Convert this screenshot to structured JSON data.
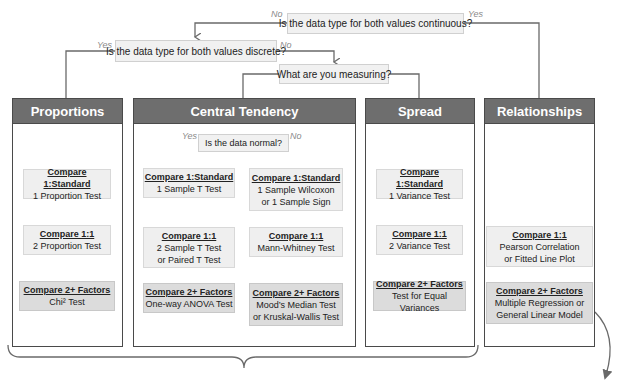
{
  "questions": {
    "continuous": "Is the data type for both values continuous?",
    "discrete": "Is the data type for both values discrete?",
    "measuring": "What are you measuring?",
    "normal": "Is the data normal?"
  },
  "branch_labels": {
    "continuous_no": "No",
    "continuous_yes": "Yes",
    "discrete_yes": "Yes",
    "discrete_no": "No",
    "normal_yes": "Yes",
    "normal_no": "No"
  },
  "panels": {
    "proportions": {
      "title": "Proportions",
      "boxes": [
        {
          "heading": "Compare 1:Standard",
          "lines": [
            "1 Proportion Test"
          ]
        },
        {
          "heading": "Compare 1:1",
          "lines": [
            "2 Proportion Test"
          ]
        },
        {
          "heading": "Compare 2+ Factors",
          "lines": [
            "Chi² Test"
          ]
        }
      ]
    },
    "central_tendency": {
      "title": "Central Tendency",
      "normal_yes": [
        {
          "heading": "Compare 1:Standard",
          "lines": [
            "1 Sample T Test"
          ]
        },
        {
          "heading": "Compare 1:1",
          "lines": [
            "2 Sample T Test",
            "or Paired T Test"
          ]
        },
        {
          "heading": "Compare 2+ Factors",
          "lines": [
            "One-way ANOVA Test"
          ]
        }
      ],
      "normal_no": [
        {
          "heading": "Compare 1:Standard",
          "lines": [
            "1 Sample Wilcoxon",
            "or 1 Sample Sign"
          ]
        },
        {
          "heading": "Compare 1:1",
          "lines": [
            "Mann-Whitney Test"
          ]
        },
        {
          "heading": "Compare 2+ Factors",
          "lines": [
            "Mood’s Median Test",
            "or Kruskal-Wallis Test"
          ]
        }
      ]
    },
    "spread": {
      "title": "Spread",
      "boxes": [
        {
          "heading": "Compare 1:Standard",
          "lines": [
            "1 Variance Test"
          ]
        },
        {
          "heading": "Compare 1:1",
          "lines": [
            "2 Variance Test"
          ]
        },
        {
          "heading": "Compare 2+ Factors",
          "lines": [
            "Test for Equal Variances"
          ]
        }
      ]
    },
    "relationships": {
      "title": "Relationships",
      "boxes": [
        {
          "heading": "Compare 1:1",
          "lines": [
            "Pearson Correlation",
            "or Fitted Line Plot"
          ]
        },
        {
          "heading": "Compare 2+ Factors",
          "lines": [
            "Multiple Regression or",
            "General Linear Model"
          ]
        }
      ]
    }
  },
  "colors": {
    "header_bg": "#6e6e6e",
    "panel_border": "#4a4a4a",
    "box_light": "#efefef",
    "box_dark": "#dcdcdc",
    "connector": "#6a6a6a",
    "branch_label": "#8a8a8a"
  }
}
